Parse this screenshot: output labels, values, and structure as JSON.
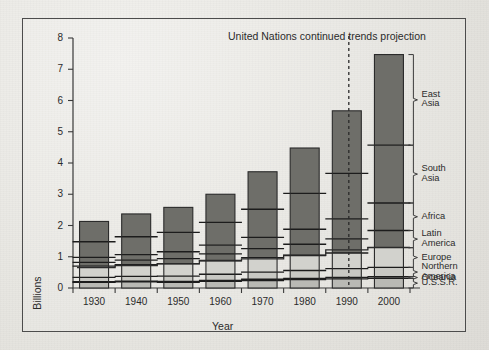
{
  "chart_data": {
    "type": "bar",
    "stacked": true,
    "title": "United Nations continued trends projection",
    "xlabel": "Year",
    "ylabel": "Billions",
    "ylim": [
      0,
      8
    ],
    "yticks": [
      0,
      1,
      2,
      3,
      4,
      5,
      6,
      7,
      8
    ],
    "categories": [
      "1930",
      "1940",
      "1950",
      "1960",
      "1970",
      "1980",
      "1990",
      "2000"
    ],
    "grid": false,
    "legend_position": "right-bracket",
    "series": [
      {
        "name": "U.S.S.R.",
        "color": "#b9b9b4",
        "values": [
          0.18,
          0.2,
          0.18,
          0.21,
          0.24,
          0.27,
          0.29,
          0.31
        ]
      },
      {
        "name": "Oceania",
        "color": "#8f8f8a",
        "values": [
          0.02,
          0.02,
          0.03,
          0.03,
          0.04,
          0.04,
          0.05,
          0.05
        ]
      },
      {
        "name": "Northern America",
        "color": "#c8c8c3",
        "values": [
          0.14,
          0.15,
          0.17,
          0.2,
          0.23,
          0.25,
          0.28,
          0.3
        ]
      },
      {
        "name": "Europe",
        "color": "#d2d2cd",
        "values": [
          0.36,
          0.38,
          0.39,
          0.43,
          0.46,
          0.48,
          0.5,
          0.63
        ]
      },
      {
        "name": "Latin America",
        "color": "#6e6e69",
        "values": [
          0.12,
          0.14,
          0.17,
          0.22,
          0.29,
          0.36,
          0.45,
          0.55
        ]
      },
      {
        "name": "Africa",
        "color": "#6e6e69",
        "values": [
          0.16,
          0.18,
          0.22,
          0.28,
          0.36,
          0.48,
          0.64,
          0.88
        ]
      },
      {
        "name": "South Asia",
        "color": "#6e6e69",
        "values": [
          0.5,
          0.57,
          0.62,
          0.73,
          0.9,
          1.15,
          1.46,
          1.85
        ]
      },
      {
        "name": "East Asia",
        "color": "#6e6e69",
        "values": [
          0.65,
          0.73,
          0.8,
          0.9,
          1.2,
          1.45,
          2.0,
          2.9
        ]
      }
    ],
    "totals": [
      2.13,
      2.37,
      2.58,
      3.0,
      3.72,
      4.48,
      5.67,
      7.47
    ],
    "developed_developing_line": [
      0.65,
      0.72,
      0.78,
      0.88,
      0.93,
      1.05,
      1.22,
      1.3
    ],
    "projection_boundary_year": "1995",
    "annotations": [
      "United Nations continued trends projection"
    ]
  },
  "legend": {
    "entries": [
      {
        "label_line1": "East",
        "label_line2": "Asia"
      },
      {
        "label_line1": "South",
        "label_line2": "Asia"
      },
      {
        "label_line1": "Africa",
        "label_line2": ""
      },
      {
        "label_line1": "Latin",
        "label_line2": "America"
      },
      {
        "label_line1": "Europe",
        "label_line2": ""
      },
      {
        "label_line1": "Northern",
        "label_line2": "America"
      },
      {
        "label_line1": "Oceania",
        "label_line2": ""
      },
      {
        "label_line1": "U.S.S.R.",
        "label_line2": ""
      }
    ]
  }
}
